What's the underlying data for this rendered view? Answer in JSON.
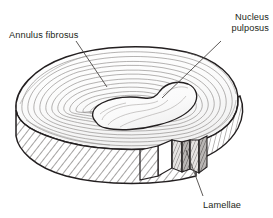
{
  "figure": {
    "background_color": "#ffffff",
    "line_color": "#231f20",
    "label_color": "#231f20"
  },
  "labels": {
    "annulus_fibrosus": "Annulus fibrosus",
    "nucleus_pulposus_line1": "Nucleus",
    "nucleus_pulposus_line2": "pulposus",
    "lamellae": "Lamellae"
  },
  "structures": [
    {
      "name": "annulus-fibrosus",
      "label": "Annulus fibrosus",
      "description": "Outer concentric fibrous rings and hatched side wall of the disc"
    },
    {
      "name": "nucleus-pulposus",
      "label": "Nucleus pulposus",
      "description": "Central kidney-shaped gelatinous core"
    },
    {
      "name": "lamellae",
      "label": "Lamellae",
      "description": "Stacked fibrous layers exposed in the wedge-shaped cutaway notch"
    }
  ]
}
